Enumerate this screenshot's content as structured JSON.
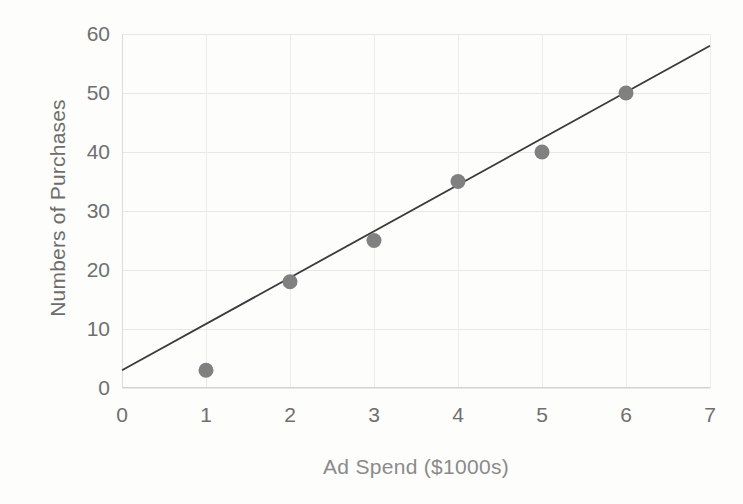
{
  "chart_data": {
    "type": "scatter",
    "title": "",
    "xlabel": "Ad Spend ($1000s)",
    "ylabel": "Numbers of Purchases",
    "xlim": [
      0,
      7
    ],
    "ylim": [
      0,
      60
    ],
    "xticks": [
      0,
      1,
      2,
      3,
      4,
      5,
      6,
      7
    ],
    "yticks": [
      0,
      10,
      20,
      30,
      40,
      50,
      60
    ],
    "xtick_labels": [
      "0",
      "1",
      "2",
      "3",
      "4",
      "5",
      "6",
      "7"
    ],
    "ytick_labels": [
      "0",
      "10",
      "20",
      "30",
      "40",
      "50",
      "60"
    ],
    "grid": true,
    "legend": false,
    "legend_position": "none",
    "series": [
      {
        "name": "Purchases",
        "kind": "scatter",
        "marker": "circle",
        "marker_color": "#808080",
        "marker_size": 15,
        "x": [
          1,
          2,
          3,
          4,
          5,
          6
        ],
        "y": [
          3,
          18,
          25,
          35,
          40,
          50
        ],
        "points": [
          {
            "x": 1,
            "y": 3
          },
          {
            "x": 2,
            "y": 18
          },
          {
            "x": 3,
            "y": 25
          },
          {
            "x": 4,
            "y": 35
          },
          {
            "x": 5,
            "y": 40
          },
          {
            "x": 6,
            "y": 50
          }
        ]
      },
      {
        "name": "Trendline",
        "kind": "line",
        "line_color": "#3a3a3a",
        "line_width": 1.8,
        "x": [
          0,
          7
        ],
        "y": [
          3,
          58
        ]
      }
    ]
  },
  "axes": {
    "y_title": "Numbers of Purchases",
    "x_title": "Ad Spend ($1000s)"
  },
  "colors": {
    "marker": "#808080",
    "trendline": "#3a3a3a",
    "grid": "#e8e8e6",
    "tick_text": "#6f6f6f",
    "axis_title": "#7d7d7d",
    "background": "#ffffff"
  }
}
